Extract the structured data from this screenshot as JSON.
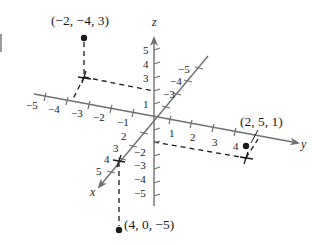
{
  "figure": {
    "axes": {
      "x": {
        "label": "x",
        "ticks": [
          "1",
          "2",
          "3",
          "4",
          "5"
        ],
        "neg_ticks": [
          "-3",
          "-4",
          "-5"
        ]
      },
      "y": {
        "label": "y",
        "ticks": [
          "1",
          "2",
          "3",
          "4"
        ],
        "neg_ticks": [
          "-1",
          "-2",
          "-3",
          "-4",
          "-5"
        ]
      },
      "z": {
        "label": "z",
        "ticks": [
          "1",
          "3",
          "4",
          "5"
        ],
        "neg_ticks": [
          "-2",
          "-3",
          "-4",
          "-5"
        ]
      }
    },
    "tick_text": {
      "x_neg3": "−3",
      "x_neg4": "−4",
      "x_neg5": "−5",
      "x_2": "2",
      "x_3": "3",
      "x_4": "4",
      "x_5": "5",
      "y_neg1": "−1",
      "y_neg2": "−2",
      "y_neg3": "−3",
      "y_neg4": "−4",
      "y_neg5": "−5",
      "y_1": "1",
      "y_2": "2",
      "y_3": "3",
      "y_4": "4",
      "z_1": "1",
      "z_3": "3",
      "z_4": "4",
      "z_5": "5",
      "z_neg2": "−2",
      "z_neg3": "−3",
      "z_neg4": "−4",
      "z_neg5": "−5"
    },
    "points": [
      {
        "label": "(−2, −4, 3)",
        "coords": [
          -2,
          -4,
          3
        ]
      },
      {
        "label": "(2, 5, 1)",
        "coords": [
          2,
          5,
          1
        ]
      },
      {
        "label": "(4, 0, −5)",
        "coords": [
          4,
          0,
          -5
        ]
      }
    ],
    "colors": {
      "axis": "#6f6f6f",
      "ink": "#1a1a1a",
      "background": "#ffffff"
    }
  }
}
